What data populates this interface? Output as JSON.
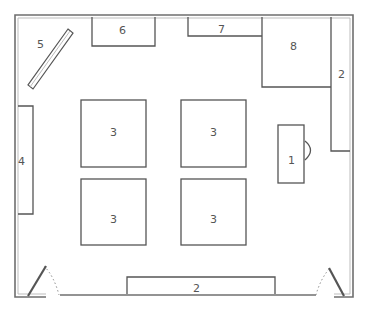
{
  "diagram": {
    "type": "floor-plan",
    "colors": {
      "wall": "#6f6f6f",
      "wall_inner": "#bdbdbd",
      "furniture": "#555555",
      "label": "#555555",
      "door_swing": "#8a8a8a",
      "background": "#ffffff"
    },
    "items": [
      {
        "id": "desk",
        "label": "1"
      },
      {
        "id": "cabinet-right",
        "label": "2"
      },
      {
        "id": "cabinet-bottom",
        "label": "2"
      },
      {
        "id": "table-top-left",
        "label": "3"
      },
      {
        "id": "table-top-right",
        "label": "3"
      },
      {
        "id": "table-bottom-left",
        "label": "3"
      },
      {
        "id": "table-bottom-right",
        "label": "3"
      },
      {
        "id": "shelf-left",
        "label": "4"
      },
      {
        "id": "board-diagonal",
        "label": "5"
      },
      {
        "id": "unit-top-left",
        "label": "6"
      },
      {
        "id": "unit-top-middle",
        "label": "7"
      },
      {
        "id": "unit-top-right",
        "label": "8"
      }
    ]
  }
}
